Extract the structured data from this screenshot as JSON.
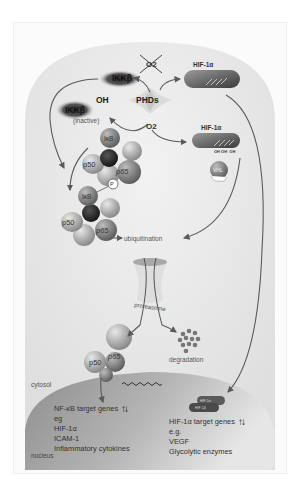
{
  "diagram": {
    "labels": {
      "ikk_active": "IKKβ",
      "ikk_inactive": "IKKβ",
      "ikk_oh": "OH",
      "ikk_inactive_note": "(inactive)",
      "phds": "PHDs",
      "o2_crossed": "O2",
      "o2": "O2",
      "hif_top": "HIF-1α",
      "hif_hydroxylated": "HIF-1α",
      "oh_groups": "OH OH  OH",
      "vhl": "VHL",
      "ikb_top": "IκB",
      "p50_top": "p50",
      "p65_top": "p65",
      "phospho": "P",
      "ikb_bottom": "IκB",
      "p50_bottom": "p50",
      "p65_bottom": "p65",
      "ubiquitination": "ubiquitination",
      "proteasome": "proteasome",
      "degradation": "degradation",
      "p50_free": "p50",
      "p65_free": "p65",
      "cytosol": "cytosol",
      "nucleus": "nucleus",
      "hif_dimer_a": "HIF-1α",
      "hif_dimer_b": "HIF-1β"
    },
    "nfkb_genes": {
      "title": "NF-κB target genes",
      "items": [
        "eg",
        "HIF-1α",
        "ICAM-1",
        "Inflammatory cytokines"
      ],
      "regulation": "↑↓"
    },
    "hif_genes": {
      "title": "HIF-1α target genes",
      "items": [
        "e.g.",
        "VEGF",
        "Glycolytic enzymes"
      ],
      "regulation": "↑↓"
    },
    "colors": {
      "cell_bg": "#e8e8e8",
      "nucleus": "#a9a9a9",
      "arrow": "#5a5a5a",
      "protein_dark": "#3a3a3a",
      "protein_mid": "#888888",
      "protein_light": "#b8b8b8"
    }
  }
}
